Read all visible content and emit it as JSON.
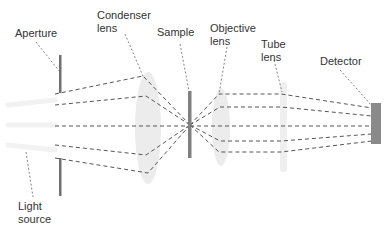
{
  "diagram": {
    "type": "optical-path",
    "title": "",
    "labels": {
      "aperture": "Aperture",
      "condenser_lens": "Condenser\nlens",
      "sample": "Sample",
      "objective_lens": "Objective\nlens",
      "tube_lens": "Tube\nlens",
      "detector": "Detector",
      "light_source": "Light\nsource"
    },
    "components": [
      {
        "id": "light-source",
        "label": "Light source",
        "order": 1
      },
      {
        "id": "aperture",
        "label": "Aperture",
        "order": 2
      },
      {
        "id": "condenser-lens",
        "label": "Condenser lens",
        "order": 3
      },
      {
        "id": "sample",
        "label": "Sample",
        "order": 4
      },
      {
        "id": "objective-lens",
        "label": "Objective lens",
        "order": 5
      },
      {
        "id": "tube-lens",
        "label": "Tube lens",
        "order": 6
      },
      {
        "id": "detector",
        "label": "Detector",
        "order": 7
      }
    ],
    "ray_count": 5,
    "colors": {
      "ray": "#555555",
      "leader": "#666666",
      "aperture": "#707070",
      "sample": "#808080",
      "detector": "#8a8a8a",
      "lens_fill": "#ececec",
      "text": "#333333"
    }
  }
}
